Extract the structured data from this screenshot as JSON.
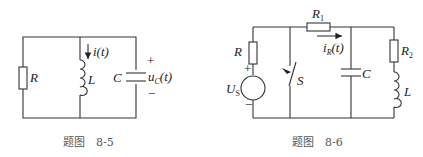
{
  "figures": [
    {
      "caption": "题图　8-5",
      "labels": {
        "resistor": "R",
        "inductor": "L",
        "capacitor": "C",
        "current": "i(t)",
        "voltage_main": "u",
        "voltage_sub": "C",
        "voltage_tail": "(t)",
        "plus": "+",
        "minus": "−"
      }
    },
    {
      "caption": "题图　8-6",
      "labels": {
        "resistor": "R",
        "resistor1_main": "R",
        "resistor1_sub": "1",
        "resistor2_main": "R",
        "resistor2_sub": "2",
        "source_main": "U",
        "source_sub": "S",
        "switch": "S",
        "capacitor": "C",
        "inductor": "L",
        "current_main": "i",
        "current_sub": "R",
        "current_tail": "(t)",
        "plus": "+",
        "minus": "−"
      }
    }
  ]
}
